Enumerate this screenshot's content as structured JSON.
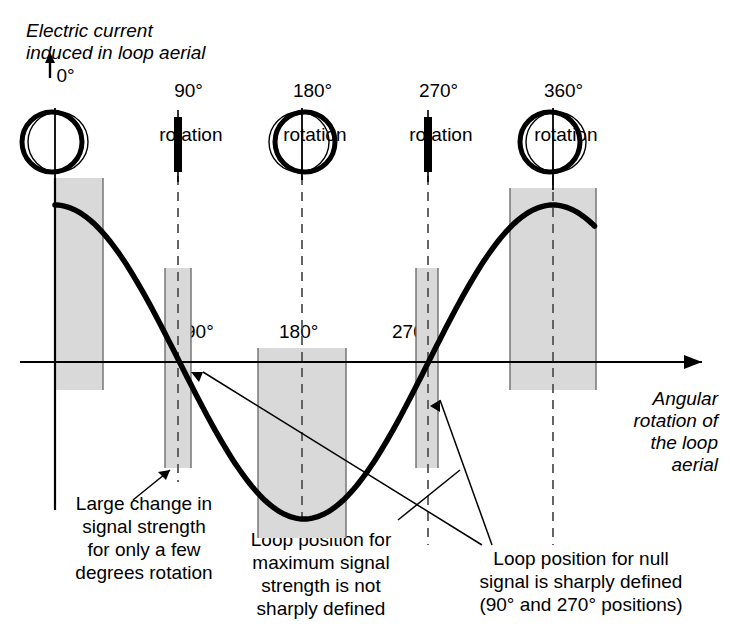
{
  "figure": {
    "title_note": "Loop aerial signal versus angular rotation diagram",
    "y_axis_label": "Electric current\ninduced in loop aerial",
    "x_axis_label": "Angular\nrotation of\nthe loop\naerial"
  },
  "colors": {
    "band_fill": "#d9d9d9",
    "band_edge": "#6e6e6e",
    "curve": "#000000",
    "axis": "#000000",
    "dashed": "#555555",
    "background": "#ffffff"
  },
  "loop_positions": [
    {
      "id": "pos-0",
      "label": "0°",
      "sublabel": "",
      "type": "circle",
      "x": 55
    },
    {
      "id": "pos-90",
      "label": "90°",
      "sublabel": "rotation",
      "type": "bar",
      "x": 178
    },
    {
      "id": "pos-180",
      "label": "180°",
      "sublabel": "rotation",
      "type": "circle",
      "x": 302
    },
    {
      "id": "pos-270",
      "label": "270°",
      "sublabel": "rotation",
      "type": "bar",
      "x": 428
    },
    {
      "id": "pos-360",
      "label": "360°",
      "sublabel": "rotation",
      "type": "circle",
      "x": 553
    }
  ],
  "axis_tick_labels": [
    {
      "id": "tick-90",
      "text": "90°",
      "x": 183,
      "y": 324
    },
    {
      "id": "tick-180",
      "text": "180°",
      "x": 277,
      "y": 324
    },
    {
      "id": "tick-270",
      "text": "270°",
      "x": 390,
      "y": 324
    },
    {
      "id": "tick-360",
      "text": "360°",
      "x": 525,
      "y": 355
    }
  ],
  "bands": [
    {
      "id": "band-0",
      "x": 55,
      "width": 48,
      "y": 178,
      "height": 210,
      "note": "0 degrees maximum signal band"
    },
    {
      "id": "band-90",
      "x": 165,
      "width": 25,
      "y": 268,
      "height": 200,
      "note": "90 degrees null band"
    },
    {
      "id": "band-180",
      "x": 258,
      "width": 88,
      "y": 348,
      "height": 190,
      "note": "180 degrees maximum signal band"
    },
    {
      "id": "band-270",
      "x": 416,
      "width": 22,
      "y": 268,
      "height": 200,
      "note": "270 degrees null band"
    },
    {
      "id": "band-360",
      "x": 510,
      "width": 86,
      "y": 188,
      "height": 200,
      "note": "360 degrees maximum signal band"
    }
  ],
  "captions": [
    {
      "id": "caption-large-change",
      "text": "Large change in\nsignal strength\nfor only a few\ndegrees rotation",
      "x": 58,
      "y": 494,
      "width": 172
    },
    {
      "id": "caption-maximum-signal",
      "text": "Loop position for\nmaximum signal\nstrength is not\nsharply defined",
      "x": 232,
      "y": 528,
      "width": 176
    },
    {
      "id": "caption-null-signal",
      "text": "Loop position for null\nsignal is sharply defined\n(90° and 270° positions)",
      "x": 447,
      "y": 548,
      "width": 268
    }
  ],
  "chart_data": {
    "type": "line",
    "title": "",
    "xlabel": "Angular rotation of the loop aerial",
    "ylabel": "Electric current induced in loop aerial",
    "xlim": [
      0,
      390
    ],
    "ylim": [
      -1,
      1
    ],
    "function": "cosine",
    "period_degrees": 360,
    "xticks": [
      0,
      90,
      180,
      270,
      360
    ],
    "xticklabels": [
      "0°",
      "90°",
      "180°",
      "270°",
      "360°"
    ],
    "grid": false,
    "legend": null,
    "x": [
      0,
      30,
      60,
      90,
      120,
      150,
      180,
      210,
      240,
      270,
      300,
      330,
      360,
      390
    ],
    "y": [
      1.0,
      0.866,
      0.5,
      0.0,
      -0.5,
      -0.866,
      -1.0,
      -0.866,
      -0.5,
      0.0,
      0.5,
      0.866,
      1.0,
      0.866
    ],
    "annotations": [
      "Large change in signal strength for only a few degrees rotation",
      "Loop position for maximum signal strength is not sharply defined",
      "Loop position for null signal is sharply defined (90° and 270° positions)"
    ]
  }
}
